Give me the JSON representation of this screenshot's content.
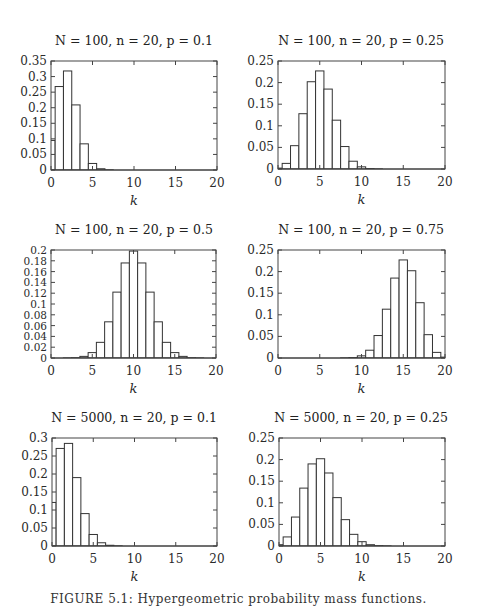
{
  "figure": {
    "caption": "FIGURE 5.1: Hypergeometric probability mass functions."
  },
  "chart_data": [
    {
      "type": "bar",
      "title": "N = 100, n = 20, p = 0.1",
      "title_parts": {
        "N": "100",
        "n": "20",
        "p": "0.1"
      },
      "xlabel": "k",
      "ylabel": "",
      "xlim": [
        0,
        20
      ],
      "ylim": [
        0,
        0.35
      ],
      "xticks": [
        0,
        5,
        10,
        15,
        20
      ],
      "yticks": [
        0,
        0.05,
        0.1,
        0.15,
        0.2,
        0.25,
        0.3,
        0.35
      ],
      "ytick_labels": [
        "0",
        "0.05",
        "0.1",
        "0.15",
        "0.2",
        "0.25",
        "0.3",
        "0.35"
      ],
      "categories": [
        0,
        1,
        2,
        3,
        4,
        5,
        6,
        7,
        8,
        9,
        10,
        11,
        12,
        13,
        14,
        15,
        16,
        17,
        18,
        19,
        20
      ],
      "values": [
        0.095,
        0.268,
        0.318,
        0.209,
        0.084,
        0.021,
        0.004,
        0.0005,
        0,
        0,
        0,
        0,
        0,
        0,
        0,
        0,
        0,
        0,
        0,
        0,
        0
      ]
    },
    {
      "type": "bar",
      "title": "N = 100, n = 20, p = 0.25",
      "title_parts": {
        "N": "100",
        "n": "20",
        "p": "0.25"
      },
      "xlabel": "k",
      "ylabel": "",
      "xlim": [
        0,
        20
      ],
      "ylim": [
        0,
        0.25
      ],
      "xticks": [
        0,
        5,
        10,
        15,
        20
      ],
      "yticks": [
        0,
        0.05,
        0.1,
        0.15,
        0.2,
        0.25
      ],
      "ytick_labels": [
        "0",
        "0.05",
        "0.1",
        "0.15",
        "0.2",
        "0.25"
      ],
      "categories": [
        0,
        1,
        2,
        3,
        4,
        5,
        6,
        7,
        8,
        9,
        10,
        11,
        12,
        13,
        14,
        15,
        16,
        17,
        18,
        19,
        20
      ],
      "values": [
        0.002,
        0.013,
        0.054,
        0.128,
        0.202,
        0.227,
        0.185,
        0.113,
        0.052,
        0.018,
        0.005,
        0.001,
        0.0002,
        0,
        0,
        0,
        0,
        0,
        0,
        0,
        0
      ]
    },
    {
      "type": "bar",
      "title": "N = 100, n = 20, p = 0.5",
      "title_parts": {
        "N": "100",
        "n": "20",
        "p": "0.5"
      },
      "xlabel": "k",
      "ylabel": "",
      "xlim": [
        0,
        20
      ],
      "ylim": [
        0,
        0.2
      ],
      "xticks": [
        0,
        5,
        10,
        15,
        20
      ],
      "yticks": [
        0,
        0.02,
        0.04,
        0.06,
        0.08,
        0.1,
        0.12,
        0.14,
        0.16,
        0.18,
        0.2
      ],
      "ytick_labels": [
        "0",
        "0.02",
        "0.04",
        "0.06",
        "0.08",
        "0.1",
        "0.12",
        "0.14",
        "0.16",
        "0.18",
        "0.2"
      ],
      "categories": [
        0,
        1,
        2,
        3,
        4,
        5,
        6,
        7,
        8,
        9,
        10,
        11,
        12,
        13,
        14,
        15,
        16,
        17,
        18,
        19,
        20
      ],
      "values": [
        0,
        0,
        0.0001,
        0.0005,
        0.003,
        0.01,
        0.029,
        0.067,
        0.122,
        0.176,
        0.198,
        0.176,
        0.122,
        0.067,
        0.029,
        0.01,
        0.003,
        0.0005,
        0.0001,
        0,
        0
      ]
    },
    {
      "type": "bar",
      "title": "N = 100, n = 20, p = 0.75",
      "title_parts": {
        "N": "100",
        "n": "20",
        "p": "0.75"
      },
      "xlabel": "k",
      "ylabel": "",
      "xlim": [
        0,
        20
      ],
      "ylim": [
        0,
        0.25
      ],
      "xticks": [
        0,
        5,
        10,
        15,
        20
      ],
      "yticks": [
        0,
        0.05,
        0.1,
        0.15,
        0.2,
        0.25
      ],
      "ytick_labels": [
        "0",
        "0.05",
        "0.1",
        "0.15",
        "0.2",
        "0.25"
      ],
      "categories": [
        0,
        1,
        2,
        3,
        4,
        5,
        6,
        7,
        8,
        9,
        10,
        11,
        12,
        13,
        14,
        15,
        16,
        17,
        18,
        19,
        20
      ],
      "values": [
        0,
        0,
        0,
        0,
        0,
        0,
        0,
        0,
        0.0002,
        0.001,
        0.005,
        0.018,
        0.052,
        0.113,
        0.185,
        0.227,
        0.202,
        0.128,
        0.054,
        0.013,
        0.002
      ]
    },
    {
      "type": "bar",
      "title": "N = 5000, n = 20, p = 0.1",
      "title_parts": {
        "N": "5000",
        "n": "20",
        "p": "0.1"
      },
      "xlabel": "k",
      "ylabel": "",
      "xlim": [
        0,
        20
      ],
      "ylim": [
        0,
        0.3
      ],
      "xticks": [
        0,
        5,
        10,
        15,
        20
      ],
      "yticks": [
        0,
        0.05,
        0.1,
        0.15,
        0.2,
        0.25,
        0.3
      ],
      "ytick_labels": [
        "0",
        "0.05",
        "0.1",
        "0.15",
        "0.2",
        "0.25",
        "0.3"
      ],
      "categories": [
        0,
        1,
        2,
        3,
        4,
        5,
        6,
        7,
        8,
        9,
        10,
        11,
        12,
        13,
        14,
        15,
        16,
        17,
        18,
        19,
        20
      ],
      "values": [
        0.121,
        0.271,
        0.285,
        0.19,
        0.09,
        0.032,
        0.009,
        0.002,
        0.0004,
        0,
        0,
        0,
        0,
        0,
        0,
        0,
        0,
        0,
        0,
        0,
        0
      ]
    },
    {
      "type": "bar",
      "title": "N = 5000, n = 20, p = 0.25",
      "title_parts": {
        "N": "5000",
        "n": "20",
        "p": "0.25"
      },
      "xlabel": "k",
      "ylabel": "",
      "xlim": [
        0,
        20
      ],
      "ylim": [
        0,
        0.25
      ],
      "xticks": [
        0,
        5,
        10,
        15,
        20
      ],
      "yticks": [
        0,
        0.05,
        0.1,
        0.15,
        0.2,
        0.25
      ],
      "ytick_labels": [
        "0",
        "0.05",
        "0.1",
        "0.15",
        "0.2",
        "0.25"
      ],
      "categories": [
        0,
        1,
        2,
        3,
        4,
        5,
        6,
        7,
        8,
        9,
        10,
        11,
        12,
        13,
        14,
        15,
        16,
        17,
        18,
        19,
        20
      ],
      "values": [
        0.003,
        0.021,
        0.067,
        0.134,
        0.19,
        0.202,
        0.169,
        0.112,
        0.061,
        0.027,
        0.01,
        0.003,
        0.0008,
        0.0002,
        0,
        0,
        0,
        0,
        0,
        0,
        0
      ]
    }
  ]
}
